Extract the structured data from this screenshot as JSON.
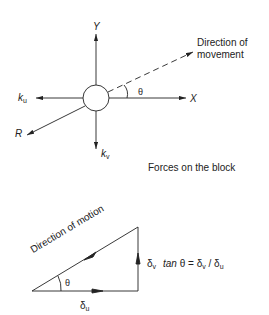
{
  "forces_diagram": {
    "axis_y_label": "Y",
    "axis_x_label": "X",
    "ku_label": "k",
    "ku_sub": "u",
    "kv_label": "k",
    "kv_sub": "v",
    "r_label": "R",
    "theta_label": "θ",
    "direction_label_line1": "Direction of",
    "direction_label_line2": "movement",
    "caption": "Forces on the block"
  },
  "triangle_diagram": {
    "hypotenuse_label": "Direction of motion",
    "theta_label": "θ",
    "delta_v_label": "δ",
    "delta_v_sub": "v",
    "formula_tan": "tan",
    "formula_theta": "θ = δ",
    "formula_mid_sub": "v",
    "formula_div": " / δ",
    "formula_end_sub": "u",
    "delta_u_label": "δ",
    "delta_u_sub": "u"
  },
  "colors": {
    "stroke": "#222222",
    "background": "#ffffff"
  }
}
